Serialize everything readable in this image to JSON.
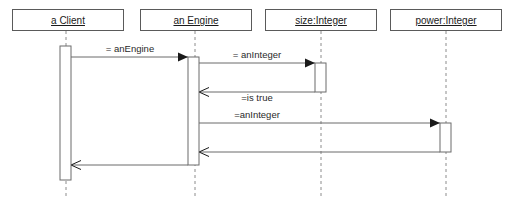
{
  "diagram": {
    "type": "uml-sequence-diagram",
    "width": 506,
    "height": 209,
    "background_color": "#ffffff",
    "line_color": "#6b6b6b",
    "lifeline_color": "#8c8c8c",
    "text_color": "#1a1a1a",
    "lifelines": [
      {
        "id": "client",
        "label": "a Client",
        "box": {
          "x": 12,
          "y": 9,
          "width": 112,
          "height": 22
        },
        "axis_x": 66,
        "dash_top": 31,
        "dash_bottom": 198,
        "activation": {
          "x": 60,
          "y": 46,
          "width": 11,
          "height": 134
        }
      },
      {
        "id": "engine",
        "label": "an Engine",
        "box": {
          "x": 140,
          "y": 9,
          "width": 112,
          "height": 22
        },
        "axis_x": 195,
        "dash_top": 31,
        "dash_bottom": 198,
        "activation": {
          "x": 188,
          "y": 57,
          "width": 11,
          "height": 108
        }
      },
      {
        "id": "size",
        "label": "size:Integer",
        "box": {
          "x": 265,
          "y": 9,
          "width": 112,
          "height": 22
        },
        "axis_x": 321,
        "dash_top": 31,
        "dash_bottom": 198,
        "activation": {
          "x": 315,
          "y": 63,
          "width": 11,
          "height": 29
        }
      },
      {
        "id": "power",
        "label": "power:Integer",
        "box": {
          "x": 390,
          "y": 9,
          "width": 112,
          "height": 22
        },
        "axis_x": 446,
        "dash_top": 31,
        "dash_bottom": 198,
        "activation": {
          "x": 440,
          "y": 123,
          "width": 11,
          "height": 29
        }
      }
    ],
    "messages": [
      {
        "id": "msg-create-engine",
        "label": "= anEngine",
        "from": "client",
        "to": "engine",
        "direction": "right",
        "head": "filled",
        "x1": 71,
        "x2": 188,
        "y": 57,
        "label_x": 130,
        "label_y": 52
      },
      {
        "id": "msg-size-aninteger",
        "label": "= anInteger",
        "from": "engine",
        "to": "size",
        "direction": "right",
        "head": "filled",
        "x1": 199,
        "x2": 315,
        "y": 63,
        "label_x": 257,
        "label_y": 58
      },
      {
        "id": "msg-return-is-true",
        "label": "=is true",
        "from": "size",
        "to": "engine",
        "direction": "left",
        "head": "open",
        "x1": 315,
        "x2": 199,
        "y": 92,
        "label_x": 257,
        "label_y": 101
      },
      {
        "id": "msg-power-aninteger",
        "label": "=anInteger",
        "from": "engine",
        "to": "power",
        "direction": "right",
        "head": "filled",
        "x1": 199,
        "x2": 440,
        "y": 123,
        "label_x": 257,
        "label_y": 118
      },
      {
        "id": "msg-return-power",
        "label": "",
        "from": "power",
        "to": "engine",
        "direction": "left",
        "head": "open",
        "x1": 440,
        "x2": 199,
        "y": 152,
        "label_x": 320,
        "label_y": 147
      },
      {
        "id": "msg-return-client",
        "label": "",
        "from": "engine",
        "to": "client",
        "direction": "left",
        "head": "open",
        "x1": 188,
        "x2": 71,
        "y": 165,
        "label_x": 130,
        "label_y": 160
      }
    ]
  }
}
